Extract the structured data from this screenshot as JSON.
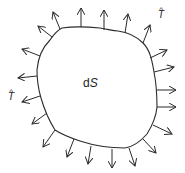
{
  "diagram": {
    "title": "",
    "colors": {
      "stroke": "#2b2b2b",
      "background": "#ffffff"
    },
    "region_label": {
      "main": "d",
      "italic": "S"
    },
    "vector_label": {
      "hat": "^",
      "letter": "T"
    },
    "boundary_path": "M62,28 C75,26 90,27 100,28 C108,29 112,31 118,31 C126,32 136,36 143,43 C150,50 152,60 154,72 C156,82 157,92 157,107 C156,118 152,126 147,134 C140,142 132,147 125,148 C110,148 95,146 80,141 C68,137 58,132 55,130 C50,122 45,112 41,98 C38,88 37,80 37,70 C38,58 42,48 50,40 C54,34 58,30 62,28 Z",
    "arrows": [
      {
        "x1": 60,
        "y1": 29,
        "x2": 53,
        "y2": 12
      },
      {
        "x1": 81,
        "y1": 27,
        "x2": 81,
        "y2": 8
      },
      {
        "x1": 104,
        "y1": 30,
        "x2": 104,
        "y2": 10
      },
      {
        "x1": 125,
        "y1": 33,
        "x2": 128,
        "y2": 14
      },
      {
        "x1": 143,
        "y1": 43,
        "x2": 150,
        "y2": 25
      },
      {
        "x1": 150,
        "y1": 58,
        "x2": 167,
        "y2": 50
      },
      {
        "x1": 154,
        "y1": 72,
        "x2": 174,
        "y2": 67
      },
      {
        "x1": 157,
        "y1": 90,
        "x2": 176,
        "y2": 90
      },
      {
        "x1": 157,
        "y1": 107,
        "x2": 176,
        "y2": 107
      },
      {
        "x1": 153,
        "y1": 125,
        "x2": 172,
        "y2": 134
      },
      {
        "x1": 143,
        "y1": 139,
        "x2": 156,
        "y2": 153
      },
      {
        "x1": 129,
        "y1": 148,
        "x2": 135,
        "y2": 166
      },
      {
        "x1": 112,
        "y1": 149,
        "x2": 112,
        "y2": 168
      },
      {
        "x1": 91,
        "y1": 146,
        "x2": 88,
        "y2": 164
      },
      {
        "x1": 74,
        "y1": 139,
        "x2": 67,
        "y2": 157
      },
      {
        "x1": 55,
        "y1": 130,
        "x2": 43,
        "y2": 147
      },
      {
        "x1": 47,
        "y1": 113,
        "x2": 32,
        "y2": 124
      },
      {
        "x1": 40,
        "y1": 96,
        "x2": 22,
        "y2": 102
      },
      {
        "x1": 37,
        "y1": 76,
        "x2": 18,
        "y2": 78
      },
      {
        "x1": 40,
        "y1": 56,
        "x2": 22,
        "y2": 49
      },
      {
        "x1": 52,
        "y1": 37,
        "x2": 38,
        "y2": 26
      }
    ]
  }
}
